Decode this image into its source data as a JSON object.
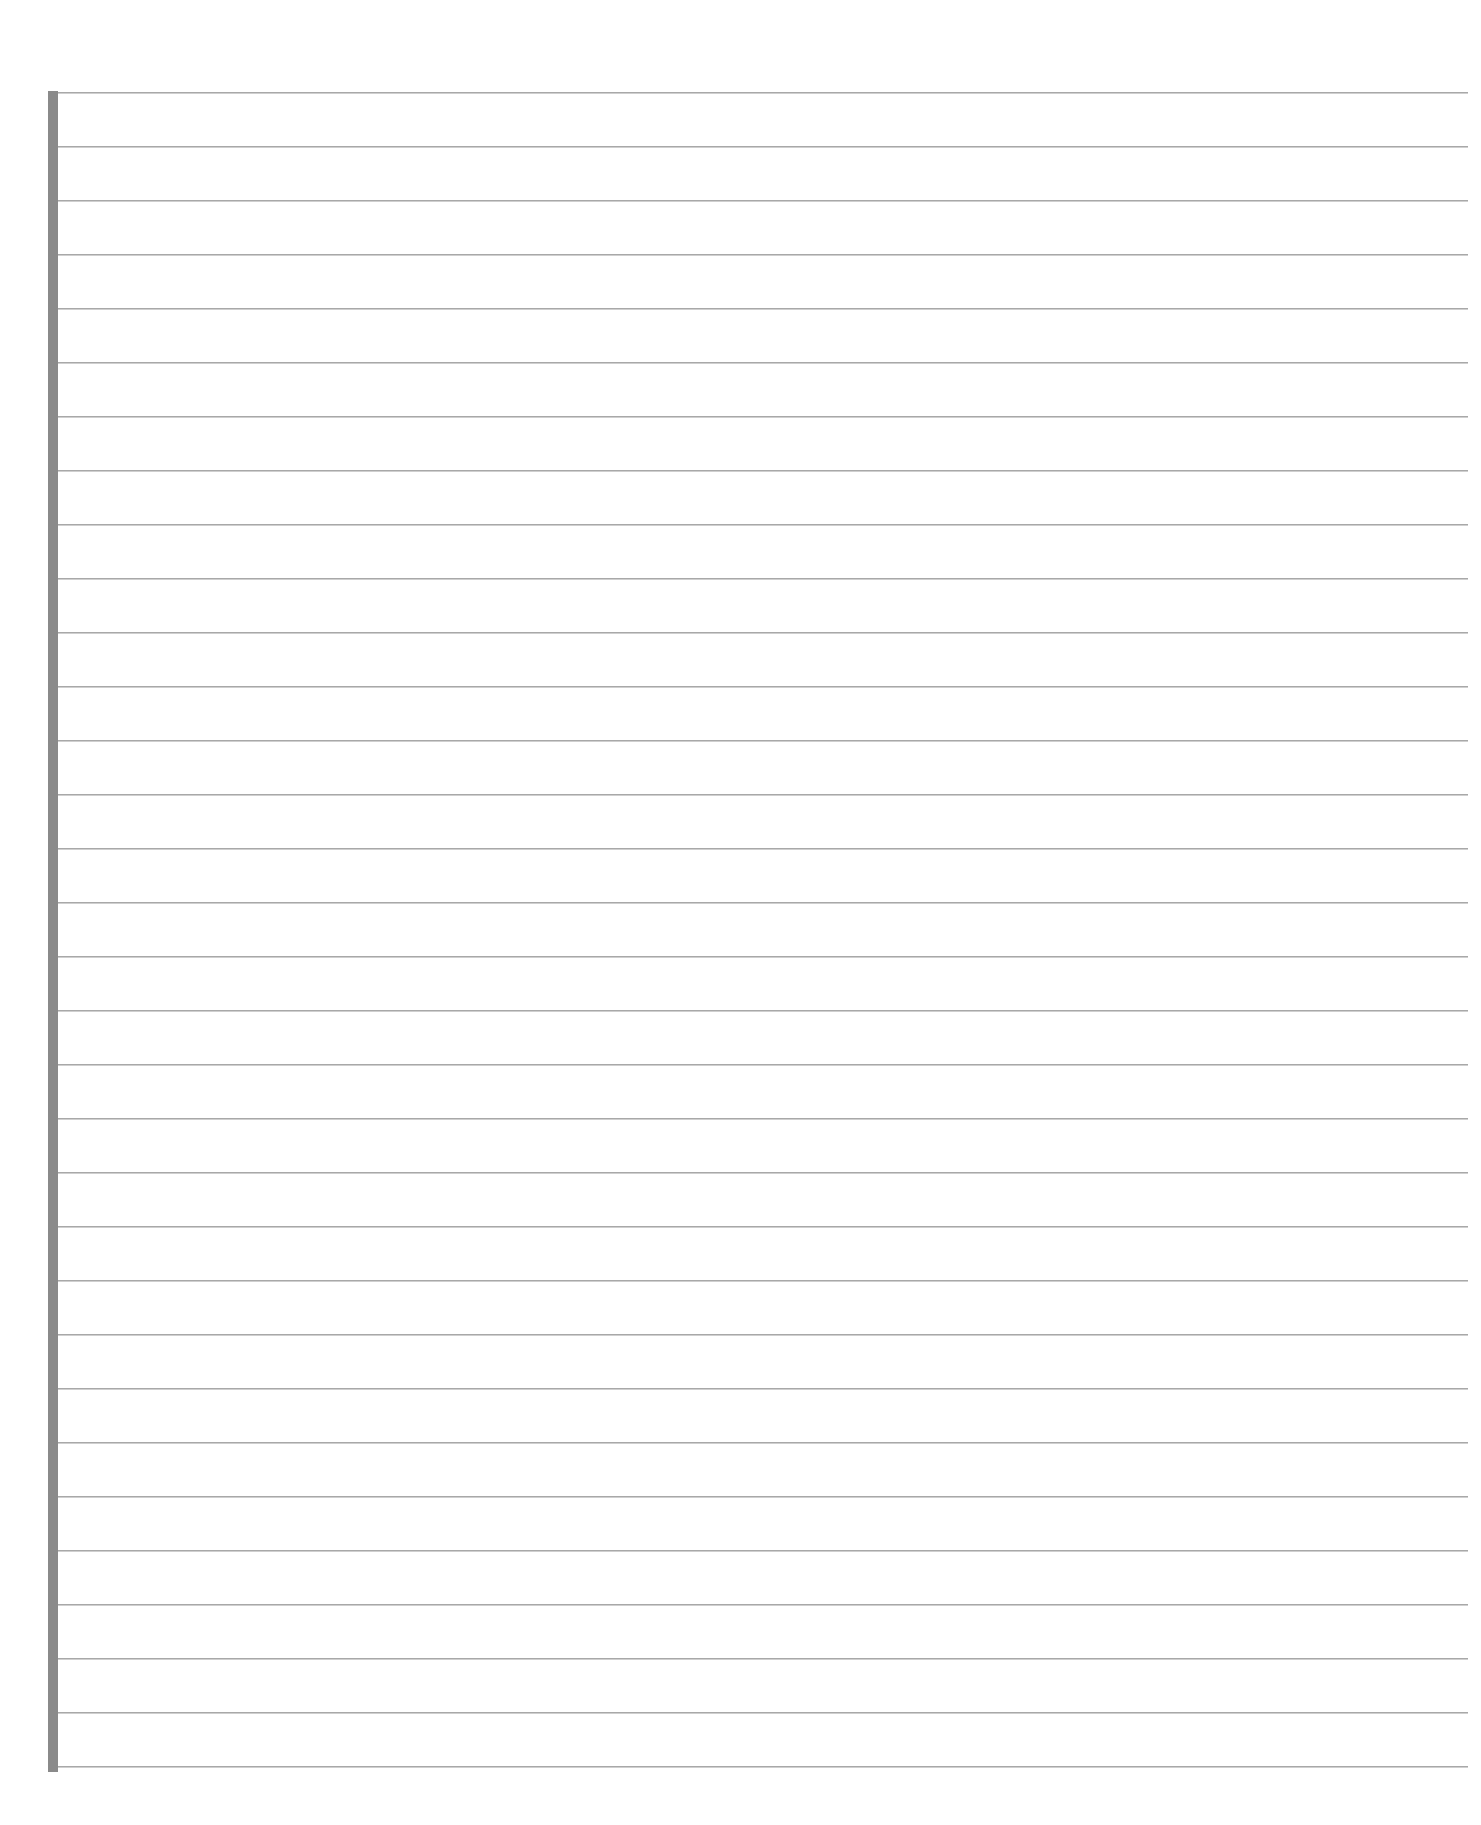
{
  "page": {
    "type": "blank-lined-paper",
    "background_color": "#ffffff",
    "margin_bar": {
      "color": "#8a8a8a",
      "left": 48,
      "top": 91,
      "width": 10,
      "height": 1681
    },
    "ruled_lines": {
      "color": "#a8a8a8",
      "count": 32,
      "first_y": 92,
      "spacing": 54,
      "left": 58,
      "right": 1468
    }
  }
}
